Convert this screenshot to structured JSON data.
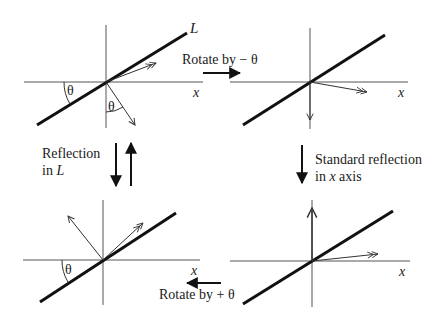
{
  "panels": {
    "top_left": {
      "axis_label": "x",
      "line_label": "L",
      "angle_label_1": "θ",
      "angle_label_2": "θ"
    },
    "top_right": {
      "axis_label": "x"
    },
    "bottom_left": {
      "axis_label": "x",
      "angle_label": "θ"
    },
    "bottom_right": {
      "axis_label": "x"
    }
  },
  "transitions": {
    "top": {
      "label": "Rotate by − θ"
    },
    "right": {
      "line1": "Standard reflection",
      "line2_prefix": "in ",
      "line2_var": "x",
      "line2_suffix": " axis"
    },
    "bottom": {
      "label": "Rotate by + θ"
    },
    "left": {
      "line1": "Reflection",
      "line2_prefix": "in ",
      "line2_var": "L"
    }
  },
  "colors": {
    "line": "#111111",
    "axis": "#555555",
    "background": "#ffffff"
  }
}
